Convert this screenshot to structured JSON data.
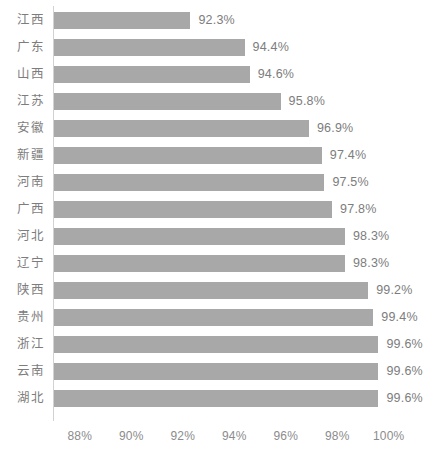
{
  "chart_data": {
    "type": "bar",
    "orientation": "horizontal",
    "title": "",
    "subtitle": "",
    "xlabel": "",
    "ylabel": "",
    "grid": false,
    "legend": null,
    "axis_origin_percent": 87.0,
    "xlim": [
      87.0,
      100.6
    ],
    "xticks": [
      "88%",
      "90%",
      "92%",
      "94%",
      "96%",
      "98%",
      "100%"
    ],
    "xtick_values": [
      88,
      90,
      92,
      94,
      96,
      98,
      100
    ],
    "categories": [
      "江西",
      "广东",
      "山西",
      "江苏",
      "安徽",
      "新疆",
      "河南",
      "广西",
      "河北",
      "辽宁",
      "陕西",
      "贵州",
      "浙江",
      "云南",
      "湖北"
    ],
    "values": [
      92.3,
      94.4,
      94.6,
      95.8,
      96.9,
      97.4,
      97.5,
      97.8,
      98.3,
      98.3,
      99.2,
      99.4,
      99.6,
      99.6,
      99.6
    ],
    "value_labels": [
      "92.3%",
      "94.4%",
      "94.6%",
      "95.8%",
      "96.9%",
      "97.4%",
      "97.5%",
      "97.8%",
      "98.3%",
      "98.3%",
      "99.2%",
      "99.4%",
      "99.6%",
      "99.6%",
      "99.6%"
    ],
    "colors": {
      "bar": "#a8a8a8",
      "label_text": "#7d7d7d",
      "tick_text": "#8c8c8c",
      "axis_line": "#d2d2d2",
      "background": "#ffffff"
    }
  }
}
